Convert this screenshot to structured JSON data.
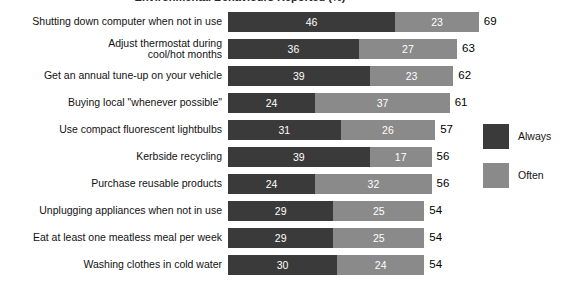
{
  "chart_data": {
    "type": "bar",
    "subtype": "stacked-horizontal",
    "title": "Environmental Behaviours Reported (%)",
    "xlabel": "",
    "ylabel": "",
    "grid": false,
    "legend_position": "right",
    "xlim": [
      0,
      69
    ],
    "categories": [
      "Shutting down computer when not in use",
      "Adjust thermostat during\ncool/hot months",
      "Get an annual tune-up on your vehicle",
      "Buying local \"whenever possible\"",
      "Use compact fluorescent lightbulbs",
      "Kerbside recycling",
      "Purchase reusable products",
      "Unplugging appliances when not in use",
      "Eat at least one meatless meal per week",
      "Washing clothes in cold water"
    ],
    "series": [
      {
        "name": "Always",
        "color": "#3a3a3a",
        "values": [
          46,
          36,
          39,
          24,
          31,
          39,
          24,
          29,
          29,
          30
        ]
      },
      {
        "name": "Often",
        "color": "#8a8a8a",
        "values": [
          23,
          27,
          23,
          37,
          26,
          17,
          32,
          25,
          25,
          24
        ]
      }
    ],
    "totals": [
      69,
      63,
      62,
      61,
      57,
      56,
      56,
      54,
      54,
      54
    ]
  },
  "legend": {
    "items": [
      {
        "label": "Always",
        "color": "#3a3a3a"
      },
      {
        "label": "Often",
        "color": "#8a8a8a"
      }
    ]
  }
}
